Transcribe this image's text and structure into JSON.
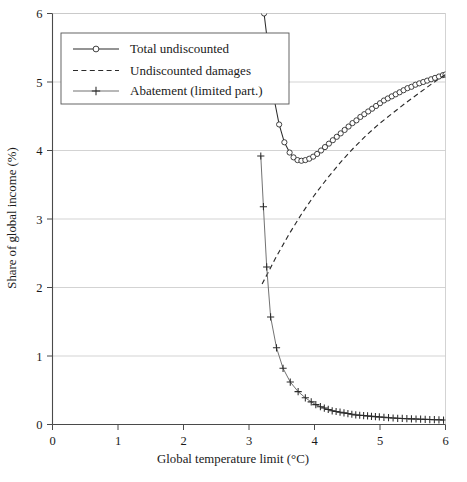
{
  "chart_data": {
    "type": "line",
    "title": "",
    "xlabel": "Global temperature limit (°C)",
    "ylabel": "Share of global income (%)",
    "xlim": [
      0,
      6
    ],
    "ylim": [
      0,
      6
    ],
    "xticks": [
      0,
      1,
      2,
      3,
      4,
      5,
      6
    ],
    "yticks": [
      0,
      1,
      2,
      3,
      4,
      5,
      6
    ],
    "xtick_labels": [
      "0",
      "1",
      "2",
      "3",
      "4",
      "5",
      "6"
    ],
    "ytick_labels": [
      "0",
      "1",
      "2",
      "3",
      "4",
      "5",
      "6"
    ],
    "grid": "horizontal",
    "legend_position": "upper-left",
    "legend_entries": [
      {
        "label": "Total undiscounted",
        "style": "line-with-circle-marker",
        "color": "#2b2b2b"
      },
      {
        "label": "Undiscounted damages",
        "style": "dashed-line",
        "color": "#2b2b2b"
      },
      {
        "label": "Abatement (limited part.)",
        "style": "line-with-plus-marker",
        "color": "#6a6a6a"
      }
    ],
    "series": [
      {
        "name": "Total undiscounted",
        "marker": "circle",
        "linestyle": "solid",
        "x": [
          3.23,
          3.3,
          3.38,
          3.46,
          3.54,
          3.62,
          3.68,
          3.74,
          3.8,
          3.86,
          3.92,
          3.98,
          4.04,
          4.1,
          4.16,
          4.22,
          4.28,
          4.34,
          4.4,
          4.46,
          4.52,
          4.58,
          4.64,
          4.7,
          4.76,
          4.82,
          4.88,
          4.94,
          5.0,
          5.06,
          5.12,
          5.18,
          5.24,
          5.3,
          5.36,
          5.42,
          5.48,
          5.54,
          5.6,
          5.66,
          5.72,
          5.78,
          5.84,
          5.9,
          5.96,
          6.0
        ],
        "y": [
          6.0,
          5.45,
          4.77,
          4.38,
          4.12,
          3.97,
          3.9,
          3.86,
          3.85,
          3.86,
          3.88,
          3.91,
          3.95,
          4.0,
          4.05,
          4.1,
          4.15,
          4.2,
          4.25,
          4.3,
          4.35,
          4.4,
          4.44,
          4.49,
          4.53,
          4.57,
          4.61,
          4.65,
          4.69,
          4.73,
          4.76,
          4.79,
          4.82,
          4.85,
          4.88,
          4.91,
          4.93,
          4.96,
          4.98,
          5.0,
          5.02,
          5.04,
          5.06,
          5.08,
          5.1,
          5.11
        ]
      },
      {
        "name": "Undiscounted damages",
        "marker": "none",
        "linestyle": "dashed",
        "x": [
          3.2,
          3.4,
          3.6,
          3.8,
          4.0,
          4.2,
          4.4,
          4.6,
          4.8,
          5.0,
          5.2,
          5.4,
          5.6,
          5.8,
          6.0
        ],
        "y": [
          2.05,
          2.42,
          2.76,
          3.07,
          3.35,
          3.6,
          3.83,
          4.04,
          4.23,
          4.4,
          4.55,
          4.7,
          4.84,
          4.98,
          5.11
        ]
      },
      {
        "name": "Abatement (limited part.)",
        "marker": "plus",
        "linestyle": "solid",
        "x": [
          3.18,
          3.22,
          3.27,
          3.33,
          3.42,
          3.52,
          3.63,
          3.75,
          3.86,
          3.95,
          4.02,
          4.09,
          4.15,
          4.21,
          4.27,
          4.33,
          4.39,
          4.45,
          4.51,
          4.57,
          4.63,
          4.69,
          4.75,
          4.81,
          4.87,
          4.93,
          4.99,
          5.06,
          5.13,
          5.2,
          5.27,
          5.34,
          5.41,
          5.48,
          5.55,
          5.62,
          5.69,
          5.76,
          5.83,
          5.9,
          5.97
        ],
        "y": [
          3.92,
          3.18,
          2.3,
          1.57,
          1.12,
          0.82,
          0.62,
          0.48,
          0.39,
          0.33,
          0.29,
          0.26,
          0.24,
          0.22,
          0.2,
          0.19,
          0.18,
          0.17,
          0.16,
          0.15,
          0.14,
          0.135,
          0.13,
          0.125,
          0.12,
          0.115,
          0.11,
          0.105,
          0.1,
          0.095,
          0.09,
          0.088,
          0.085,
          0.082,
          0.08,
          0.078,
          0.075,
          0.072,
          0.07,
          0.068,
          0.065
        ]
      }
    ]
  }
}
